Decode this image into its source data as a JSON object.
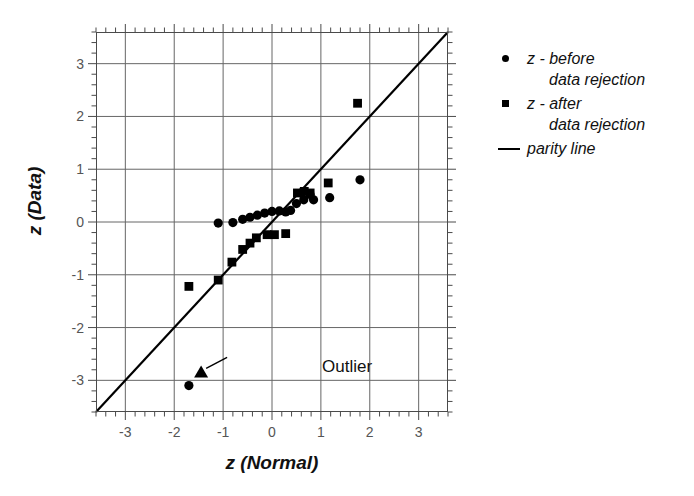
{
  "chart_data": {
    "type": "scatter",
    "title": "",
    "xlabel": "z (Normal)",
    "ylabel": "z (Data)",
    "xlim": [
      -3.6,
      3.6
    ],
    "ylim": [
      -3.6,
      3.6
    ],
    "grid": true,
    "xticks": [
      -3,
      -2,
      -1,
      0,
      1,
      2,
      3
    ],
    "yticks": [
      -3,
      -2,
      -1,
      0,
      1,
      2,
      3
    ],
    "xtick_labels": [
      "-3",
      "-2",
      "-1",
      "0",
      "1",
      "2",
      "3"
    ],
    "ytick_labels": [
      "-3",
      "-2",
      "-1",
      "0",
      "1",
      "2",
      "3"
    ],
    "minor_ticks_per_interval": 5,
    "legend_position": "right",
    "series": [
      {
        "name": "z - before data rejection",
        "marker": "circle",
        "color": "#000000",
        "points": [
          [
            -1.7,
            -3.1
          ],
          [
            -1.1,
            -0.02
          ],
          [
            -0.8,
            -0.01
          ],
          [
            -0.6,
            0.05
          ],
          [
            -0.45,
            0.09
          ],
          [
            -0.3,
            0.13
          ],
          [
            -0.15,
            0.17
          ],
          [
            0.0,
            0.2
          ],
          [
            0.15,
            0.21
          ],
          [
            0.28,
            0.19
          ],
          [
            0.38,
            0.22
          ],
          [
            0.5,
            0.35
          ],
          [
            0.6,
            0.55
          ],
          [
            0.65,
            0.42
          ],
          [
            0.78,
            0.52
          ],
          [
            0.85,
            0.42
          ],
          [
            1.18,
            0.46
          ],
          [
            1.8,
            0.8
          ]
        ]
      },
      {
        "name": "z - after data rejection",
        "marker": "square",
        "color": "#000000",
        "points": [
          [
            -1.7,
            -1.22
          ],
          [
            -1.1,
            -1.1
          ],
          [
            -0.82,
            -0.76
          ],
          [
            -0.6,
            -0.52
          ],
          [
            -0.45,
            -0.4
          ],
          [
            -0.32,
            -0.3
          ],
          [
            -0.1,
            -0.24
          ],
          [
            0.05,
            -0.24
          ],
          [
            0.28,
            -0.22
          ],
          [
            0.52,
            0.55
          ],
          [
            0.66,
            0.58
          ],
          [
            0.78,
            0.55
          ],
          [
            1.15,
            0.74
          ],
          [
            1.75,
            2.25
          ]
        ]
      }
    ],
    "reference_line": {
      "name": "parity line",
      "type": "identity",
      "from": [
        -3.6,
        -3.6
      ],
      "to": [
        3.6,
        3.6
      ],
      "color": "#000000"
    },
    "annotations": [
      {
        "text": "Outlier",
        "target_point": [
          -1.45,
          -2.85
        ],
        "marker": "triangle"
      }
    ]
  },
  "axis": {
    "x_title": "z (Normal)",
    "y_title": "z (Data)"
  },
  "legend": {
    "entries": [
      {
        "marker": "circle",
        "line1": "z - before",
        "line2": "data rejection"
      },
      {
        "marker": "square",
        "line1": "z - after",
        "line2": "data rejection"
      },
      {
        "marker": "line",
        "line1": "parity line",
        "line2": ""
      }
    ]
  },
  "annotation": {
    "outlier_label": "Outlier"
  },
  "colors": {
    "marker": "#000000",
    "axis": "#4a4a4a",
    "grid": "#666666",
    "text": "#111111",
    "tick_text": "#555555",
    "background": "#ffffff"
  }
}
